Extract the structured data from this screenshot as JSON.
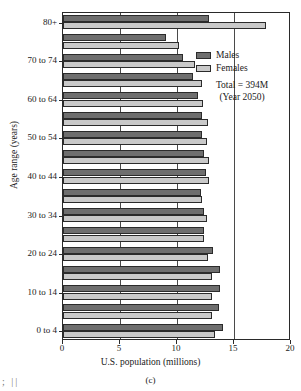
{
  "chart_data": {
    "type": "bar",
    "title": "",
    "subtitle": "",
    "xlabel": "U.S. population (millions)",
    "ylabel": "Age range (years)",
    "orientation": "horizontal",
    "grouped": true,
    "xlim": [
      0,
      20
    ],
    "xticks": [
      0,
      5,
      10,
      15,
      20
    ],
    "xtick_labels": [
      "0",
      "5",
      "10",
      "15",
      "20"
    ],
    "grid": "vertical gridlines at 5, 10 and 15",
    "legend_position": "upper right inside plot",
    "categories": [
      "0 to 4",
      "5 to 9",
      "10 to 14",
      "15 to 19",
      "20 to 24",
      "25 to 29",
      "30 to 34",
      "35 to 39",
      "40 to 44",
      "45 to 49",
      "50 to 54",
      "55 to 59",
      "60 to 64",
      "65 to 69",
      "70 to 74",
      "75 to 79",
      "80+"
    ],
    "ytick_labels": [
      "0 to 4",
      "10 to 14",
      "20 to 24",
      "30 to 34",
      "40 to 44",
      "50 to 54",
      "60 to 64",
      "70 to 74",
      "80+"
    ],
    "series": [
      {
        "name": "Males",
        "color": "#6e6e6e",
        "values": [
          14.0,
          13.7,
          13.8,
          13.8,
          13.2,
          12.4,
          12.4,
          12.1,
          12.5,
          12.4,
          12.2,
          12.2,
          11.8,
          11.4,
          10.5,
          9.0,
          12.8
        ]
      },
      {
        "name": "Females",
        "color": "#c9c9c9",
        "values": [
          13.3,
          13.1,
          13.1,
          13.1,
          12.7,
          12.4,
          12.6,
          12.2,
          12.8,
          12.8,
          12.6,
          12.7,
          12.3,
          12.2,
          11.6,
          10.2,
          17.8
        ]
      }
    ],
    "annotations": [
      "Total = 394M",
      "(Year 2050)"
    ]
  },
  "legend": {
    "males_label": "Males",
    "females_label": "Females",
    "total_label": "Total = 394M",
    "year_label": "(Year 2050)"
  },
  "caption": {
    "panel": "(c)"
  },
  "artifact": {
    "marks": ";  ||"
  }
}
